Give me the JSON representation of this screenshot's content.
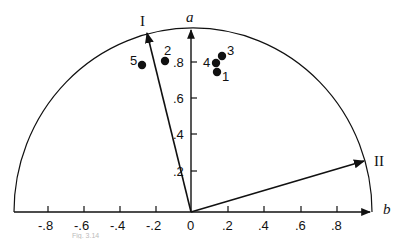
{
  "diagram": {
    "axes": {
      "x_name": "b",
      "y_name": "a",
      "x_ticks": [
        "-.8",
        "-.6",
        "-.4",
        "-.2",
        "0",
        ".2",
        ".4",
        ".6",
        ".8"
      ],
      "y_ticks": [
        ".2",
        ".4",
        ".6",
        ".8"
      ]
    },
    "vectors": [
      {
        "label": "I",
        "b": -0.25,
        "a": 0.99
      },
      {
        "label": "II",
        "b": 0.95,
        "a": 0.28
      }
    ],
    "points": [
      {
        "label": "1",
        "b": 0.14,
        "a": 0.76
      },
      {
        "label": "2",
        "b": -0.14,
        "a": 0.82
      },
      {
        "label": "3",
        "b": 0.17,
        "a": 0.85
      },
      {
        "label": "4",
        "b": 0.14,
        "a": 0.81
      },
      {
        "label": "5",
        "b": -0.27,
        "a": 0.8
      }
    ],
    "boundary": "unit semicircle",
    "caption": "Fig. 3.14"
  }
}
